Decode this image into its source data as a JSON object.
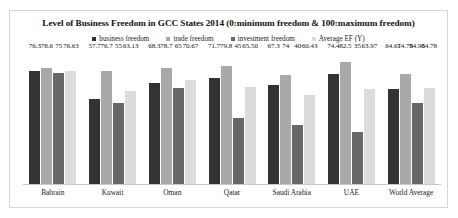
{
  "chart_data": {
    "type": "bar",
    "title": "Level of Business Freedom in GCC States 2014 (0:minimum freedom & 100:maximum freedom)",
    "xlabel": "",
    "ylabel": "",
    "ylim": [
      0,
      90
    ],
    "grid": false,
    "legend_position": "top-center",
    "categories": [
      "Bahrain",
      "Kuwait",
      "Oman",
      "Qatar",
      "Saudi Arabia",
      "UAE",
      "World Average"
    ],
    "series": [
      {
        "name": "business freedom",
        "color": "#333333",
        "values": [
          76.3,
          57.7,
          68.3,
          71.7,
          67.3,
          74.4,
          64.61
        ],
        "labels": [
          "76.3",
          "57.7",
          "68.3",
          "71.7",
          "67.3",
          "74.4",
          "64.61"
        ]
      },
      {
        "name": "trade freedom",
        "color": "#a9a9a9",
        "values": [
          78.6,
          76.7,
          78.7,
          79.8,
          74,
          82.5,
          74.78
        ],
        "labels": [
          "78.6",
          "76.7",
          "78.7",
          "79.8",
          "74",
          "82.5",
          "74.78"
        ]
      },
      {
        "name": "investment freedom",
        "color": "#676767",
        "values": [
          75,
          55,
          65,
          45,
          40,
          35,
          54.95
        ],
        "labels": [
          "75",
          "55",
          "65",
          "45",
          "40",
          "35",
          "54.95"
        ]
      },
      {
        "name": "Average EF (Y)",
        "color": "#dcdcdc",
        "values": [
          76.63,
          63.13,
          70.67,
          65.5,
          60.43,
          63.97,
          64.78
        ],
        "labels": [
          "76.63",
          "63.13",
          "70.67",
          "65.50",
          "60.43",
          "63.97",
          "64.78"
        ]
      }
    ]
  }
}
